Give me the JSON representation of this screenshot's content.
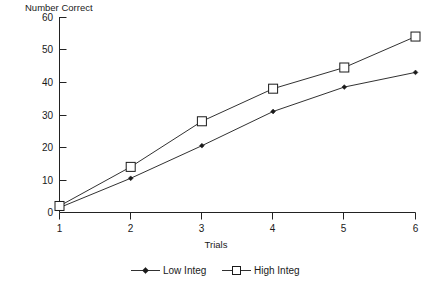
{
  "chart_data": {
    "type": "line",
    "title": "",
    "xlabel": "Trials",
    "ylabel": "Number Correct",
    "x": [
      1,
      2,
      3,
      4,
      5,
      6
    ],
    "xtick_labels": [
      "1",
      "2",
      "3",
      "4",
      "5",
      "6"
    ],
    "ytick_labels": [
      "0",
      "10",
      "20",
      "30",
      "40",
      "50",
      "60"
    ],
    "yticks": [
      0,
      10,
      20,
      30,
      40,
      50,
      60
    ],
    "xlim": [
      1,
      6
    ],
    "ylim": [
      0,
      60
    ],
    "grid": false,
    "legend_position": "bottom",
    "series": [
      {
        "name": "Low Integ",
        "marker": "filled-diamond",
        "values": [
          1.5,
          10.5,
          20.5,
          31,
          38.5,
          43
        ]
      },
      {
        "name": "High Integ",
        "marker": "open-square",
        "values": [
          2,
          14,
          28,
          38,
          44.5,
          54
        ]
      }
    ]
  },
  "legend": {
    "entries": [
      {
        "label": "Low Integ"
      },
      {
        "label": "High Integ"
      }
    ]
  },
  "colors": {
    "ink": "#1a1a1a",
    "background": "#ffffff"
  }
}
